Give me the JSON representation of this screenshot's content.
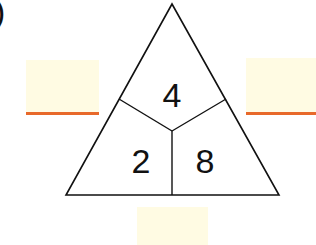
{
  "label_fragment": ")",
  "triangle": {
    "top": "4",
    "bottom_left": "2",
    "bottom_right": "8",
    "stroke_color": "#111111"
  },
  "answer_boxes": {
    "left": {
      "value": "",
      "fill": "#fffbe3",
      "underline_color": "#e8692a"
    },
    "right": {
      "value": "",
      "fill": "#fffbe3",
      "underline_color": "#e8692a"
    },
    "bottom": {
      "value": "",
      "fill": "#fffbe3"
    }
  }
}
